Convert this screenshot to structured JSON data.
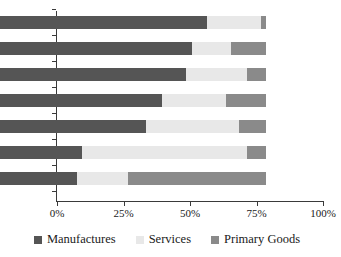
{
  "chart_data": {
    "type": "bar",
    "orientation": "horizontal",
    "stacked": true,
    "normalized": true,
    "title": "",
    "xlabel": "",
    "ylabel": "",
    "xlim": [
      0,
      100
    ],
    "grid": false,
    "legend_position": "bottom",
    "categories": [
      "Japan",
      "Italy",
      "Germany",
      "France",
      "US",
      "UK",
      "Canada"
    ],
    "x_tick_labels": [
      "0%",
      "25%",
      "50%",
      "75%",
      "100%"
    ],
    "x_tick_values": [
      0,
      25,
      50,
      75,
      100
    ],
    "series": [
      {
        "name": "Manufactures",
        "color": "#555555",
        "values": [
          78,
          72,
          70,
          61,
          55,
          31,
          29
        ]
      },
      {
        "name": "Services",
        "color": "#e8e8e8",
        "values": [
          20,
          15,
          23,
          24,
          35,
          62,
          19
        ]
      },
      {
        "name": "Primary Goods",
        "color": "#8a8a8a",
        "values": [
          2,
          13,
          7,
          15,
          10,
          7,
          52
        ]
      }
    ]
  },
  "legend": {
    "items": [
      {
        "label": "Manufactures",
        "color": "#555555"
      },
      {
        "label": "Services",
        "color": "#e8e8e8"
      },
      {
        "label": "Primary Goods",
        "color": "#8a8a8a"
      }
    ]
  },
  "axis": {
    "x_labels": [
      "0%",
      "25%",
      "50%",
      "75%",
      "100%"
    ],
    "y_labels": [
      "Japan",
      "Italy",
      "Germany",
      "France",
      "US",
      "UK",
      "Canada"
    ]
  }
}
